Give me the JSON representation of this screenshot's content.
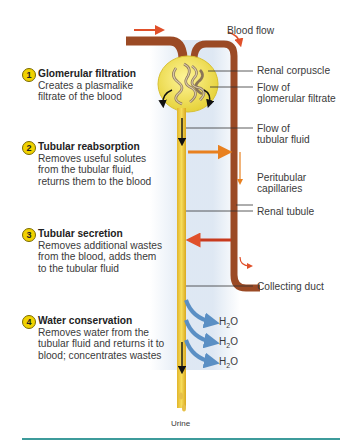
{
  "diagram": {
    "blood_flow_label": "Blood flow",
    "steps": [
      {
        "number": "1",
        "title": "Glomerular filtration",
        "description_lines": [
          "Creates a plasmalike",
          "filtrate of the blood"
        ]
      },
      {
        "number": "2",
        "title": "Tubular reabsorption",
        "description_lines": [
          "Removes useful solutes",
          "from the tubular fluid,",
          "returns them to the blood"
        ]
      },
      {
        "number": "3",
        "title": "Tubular secretion",
        "description_lines": [
          "Removes additional wastes",
          "from the blood, adds them",
          "to the tubular fluid"
        ]
      },
      {
        "number": "4",
        "title": "Water conservation",
        "description_lines": [
          "Removes water from the",
          "tubular fluid and returns it to",
          "blood; concentrates wastes"
        ]
      }
    ],
    "labels": {
      "renal_corpuscle": "Renal corpuscle",
      "flow_glomerular_line1": "Flow of",
      "flow_glomerular_line2": "glomerular filtrate",
      "flow_tubular_line1": "Flow of",
      "flow_tubular_line2": "tubular fluid",
      "peritubular_line1": "Peritubular",
      "peritubular_line2": "capillaries",
      "renal_tubule": "Renal tubule",
      "collecting_duct": "Collecting duct",
      "urine": "Urine"
    },
    "water": {
      "base": "H",
      "sub": "2",
      "tail": "O",
      "count": 3
    },
    "colors": {
      "tubule": "#f0d24a",
      "tubule_edge": "#d9a820",
      "capillary": "#a0522d",
      "reabsorption_arrow": "#e8801f",
      "secretion_arrow": "#c83a1e",
      "water_arrow": "#5a8fc4",
      "accent_line": "#3d9b9b"
    }
  }
}
